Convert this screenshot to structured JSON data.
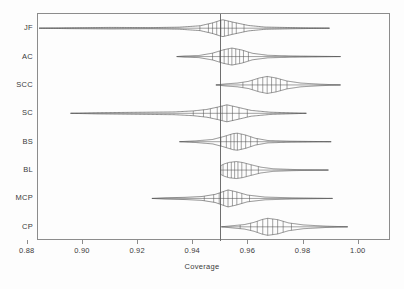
{
  "figure": {
    "axis_title_x": "Coverage",
    "axis_title_y": "",
    "title": ""
  },
  "axis": {
    "x_ticks": [
      "0.88",
      "0.90",
      "0.92",
      "0.94",
      "0.96",
      "0.98",
      "1.00"
    ],
    "y_ticks": [
      "JF",
      "AC",
      "SCC",
      "SC",
      "BS",
      "BL",
      "MCP",
      "CP"
    ],
    "reference_line_value": "0.95"
  },
  "colors": {
    "frame": "#8c8c8c",
    "violin_stroke": "#555555",
    "reference_line": "#6f6f6f",
    "text": "#3a3a3a",
    "background": "#fdfdfd"
  },
  "chart_data": {
    "type": "violin",
    "title": "",
    "xlabel": "Coverage",
    "ylabel": "",
    "xlim": [
      0.8837,
      1.0117
    ],
    "xticks": [
      0.88,
      0.9,
      0.92,
      0.94,
      0.96,
      0.98,
      1.0
    ],
    "grid": false,
    "legend": null,
    "annotations": [
      {
        "type": "vline",
        "value": 0.95,
        "label": "nominal coverage 0.95"
      }
    ],
    "categories": [
      "JF",
      "AC",
      "SCC",
      "SC",
      "BS",
      "BL",
      "MCP",
      "CP"
    ],
    "series": [
      {
        "name": "JF",
        "min": 0.8841,
        "max": 0.9894,
        "median": 0.9506,
        "q1": 0.9462,
        "q3": 0.9556,
        "quantile_marks": [
          0.9424,
          0.9455,
          0.947,
          0.9485,
          0.95,
          0.9513,
          0.9527,
          0.9541,
          0.9556,
          0.9584
        ],
        "density_profile": [
          {
            "x": 0.8841,
            "w": 0.0
          },
          {
            "x": 0.894,
            "w": 0.05
          },
          {
            "x": 0.91,
            "w": 0.09
          },
          {
            "x": 0.925,
            "w": 0.07
          },
          {
            "x": 0.935,
            "w": 0.12
          },
          {
            "x": 0.9424,
            "w": 0.28
          },
          {
            "x": 0.947,
            "w": 0.62
          },
          {
            "x": 0.9506,
            "w": 1.0
          },
          {
            "x": 0.9545,
            "w": 0.7
          },
          {
            "x": 0.96,
            "w": 0.32
          },
          {
            "x": 0.966,
            "w": 0.13
          },
          {
            "x": 0.976,
            "w": 0.07
          },
          {
            "x": 0.9894,
            "w": 0.0
          }
        ]
      },
      {
        "name": "AC",
        "min": 0.934,
        "max": 0.9934,
        "median": 0.9538,
        "q1": 0.95,
        "q3": 0.9582,
        "quantile_marks": [
          0.947,
          0.9496,
          0.9512,
          0.9527,
          0.954,
          0.9554,
          0.9568,
          0.9582,
          0.96
        ],
        "density_profile": [
          {
            "x": 0.934,
            "w": 0.0
          },
          {
            "x": 0.937,
            "w": 0.07
          },
          {
            "x": 0.942,
            "w": 0.12
          },
          {
            "x": 0.947,
            "w": 0.4
          },
          {
            "x": 0.951,
            "w": 0.8
          },
          {
            "x": 0.954,
            "w": 1.0
          },
          {
            "x": 0.9575,
            "w": 0.78
          },
          {
            "x": 0.9615,
            "w": 0.38
          },
          {
            "x": 0.967,
            "w": 0.15
          },
          {
            "x": 0.976,
            "w": 0.07
          },
          {
            "x": 0.9934,
            "w": 0.0
          }
        ]
      },
      {
        "name": "SCC",
        "min": 0.9482,
        "max": 0.9934,
        "median": 0.9668,
        "q1": 0.9618,
        "q3": 0.9714,
        "quantile_marks": [
          0.958,
          0.9614,
          0.9634,
          0.9652,
          0.9668,
          0.9684,
          0.97,
          0.9716,
          0.974
        ],
        "density_profile": [
          {
            "x": 0.9482,
            "w": 0.0
          },
          {
            "x": 0.952,
            "w": 0.13
          },
          {
            "x": 0.956,
            "w": 0.22
          },
          {
            "x": 0.96,
            "w": 0.42
          },
          {
            "x": 0.964,
            "w": 0.82
          },
          {
            "x": 0.9668,
            "w": 1.0
          },
          {
            "x": 0.97,
            "w": 0.82
          },
          {
            "x": 0.974,
            "w": 0.46
          },
          {
            "x": 0.979,
            "w": 0.22
          },
          {
            "x": 0.986,
            "w": 0.09
          },
          {
            "x": 0.9934,
            "w": 0.0
          }
        ]
      },
      {
        "name": "SC",
        "min": 0.8955,
        "max": 0.981,
        "median": 0.952,
        "q1": 0.945,
        "q3": 0.958,
        "quantile_marks": [
          0.94,
          0.9437,
          0.9462,
          0.9487,
          0.9505,
          0.9522,
          0.9542,
          0.9566,
          0.9596
        ],
        "density_profile": [
          {
            "x": 0.8955,
            "w": 0.0
          },
          {
            "x": 0.905,
            "w": 0.07
          },
          {
            "x": 0.92,
            "w": 0.12
          },
          {
            "x": 0.933,
            "w": 0.16
          },
          {
            "x": 0.94,
            "w": 0.28
          },
          {
            "x": 0.945,
            "w": 0.46
          },
          {
            "x": 0.949,
            "w": 0.74
          },
          {
            "x": 0.9522,
            "w": 1.0
          },
          {
            "x": 0.956,
            "w": 0.72
          },
          {
            "x": 0.961,
            "w": 0.34
          },
          {
            "x": 0.968,
            "w": 0.13
          },
          {
            "x": 0.981,
            "w": 0.0
          }
        ]
      },
      {
        "name": "BS",
        "min": 0.935,
        "max": 0.99,
        "median": 0.9558,
        "q1": 0.9522,
        "q3": 0.96,
        "quantile_marks": [
          0.95,
          0.952,
          0.9536,
          0.9548,
          0.956,
          0.9574,
          0.959,
          0.9608,
          0.9632
        ],
        "density_profile": [
          {
            "x": 0.935,
            "w": 0.0
          },
          {
            "x": 0.941,
            "w": 0.1
          },
          {
            "x": 0.947,
            "w": 0.26
          },
          {
            "x": 0.951,
            "w": 0.6
          },
          {
            "x": 0.9545,
            "w": 0.95
          },
          {
            "x": 0.956,
            "w": 1.0
          },
          {
            "x": 0.959,
            "w": 0.78
          },
          {
            "x": 0.9625,
            "w": 0.4
          },
          {
            "x": 0.967,
            "w": 0.14
          },
          {
            "x": 0.975,
            "w": 0.06
          },
          {
            "x": 0.99,
            "w": 0.0
          }
        ]
      },
      {
        "name": "BL",
        "min": 0.95,
        "max": 0.989,
        "median": 0.956,
        "q1": 0.9528,
        "q3": 0.9602,
        "quantile_marks": [
          0.9508,
          0.9524,
          0.9538,
          0.955,
          0.9562,
          0.9576,
          0.9592,
          0.961,
          0.9636
        ],
        "density_profile": [
          {
            "x": 0.95,
            "w": 0.52
          },
          {
            "x": 0.9512,
            "w": 0.72
          },
          {
            "x": 0.953,
            "w": 0.9
          },
          {
            "x": 0.9556,
            "w": 1.0
          },
          {
            "x": 0.958,
            "w": 0.88
          },
          {
            "x": 0.961,
            "w": 0.62
          },
          {
            "x": 0.9645,
            "w": 0.34
          },
          {
            "x": 0.969,
            "w": 0.15
          },
          {
            "x": 0.976,
            "w": 0.07
          },
          {
            "x": 0.989,
            "w": 0.0
          }
        ]
      },
      {
        "name": "MCP",
        "min": 0.925,
        "max": 0.9905,
        "median": 0.9525,
        "q1": 0.9482,
        "q3": 0.9572,
        "quantile_marks": [
          0.944,
          0.9474,
          0.9494,
          0.951,
          0.9526,
          0.9542,
          0.9558,
          0.9576,
          0.9604
        ],
        "density_profile": [
          {
            "x": 0.925,
            "w": 0.0
          },
          {
            "x": 0.93,
            "w": 0.08
          },
          {
            "x": 0.937,
            "w": 0.13
          },
          {
            "x": 0.943,
            "w": 0.22
          },
          {
            "x": 0.948,
            "w": 0.48
          },
          {
            "x": 0.951,
            "w": 0.82
          },
          {
            "x": 0.9526,
            "w": 1.0
          },
          {
            "x": 0.9556,
            "w": 0.78
          },
          {
            "x": 0.9596,
            "w": 0.4
          },
          {
            "x": 0.966,
            "w": 0.16
          },
          {
            "x": 0.976,
            "w": 0.07
          },
          {
            "x": 0.9905,
            "w": 0.0
          }
        ]
      },
      {
        "name": "CP",
        "min": 0.9502,
        "max": 0.996,
        "median": 0.9668,
        "q1": 0.9614,
        "q3": 0.9716,
        "quantile_marks": [
          0.957,
          0.9608,
          0.9632,
          0.9652,
          0.967,
          0.9688,
          0.9706,
          0.9726,
          0.9756
        ],
        "density_profile": [
          {
            "x": 0.9502,
            "w": 0.0
          },
          {
            "x": 0.9545,
            "w": 0.14
          },
          {
            "x": 0.9585,
            "w": 0.26
          },
          {
            "x": 0.962,
            "w": 0.52
          },
          {
            "x": 0.965,
            "w": 0.86
          },
          {
            "x": 0.967,
            "w": 1.0
          },
          {
            "x": 0.9706,
            "w": 0.84
          },
          {
            "x": 0.9745,
            "w": 0.46
          },
          {
            "x": 0.98,
            "w": 0.22
          },
          {
            "x": 0.988,
            "w": 0.08
          },
          {
            "x": 0.996,
            "w": 0.0
          }
        ]
      }
    ]
  }
}
